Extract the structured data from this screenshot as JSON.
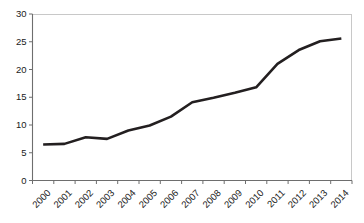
{
  "chart_data": {
    "type": "line",
    "title": "",
    "subtitle": "",
    "xlabel": "",
    "ylabel": "",
    "categories": [
      "2000",
      "2001",
      "2002",
      "2003",
      "2004",
      "2005",
      "2006",
      "2007",
      "2008",
      "2009",
      "2010",
      "2011",
      "2012",
      "2013",
      "2014"
    ],
    "series": [
      {
        "name": "",
        "values": [
          6.5,
          6.6,
          7.8,
          7.5,
          9.0,
          9.9,
          11.5,
          14.1,
          14.9,
          15.8,
          16.8,
          21.0,
          23.5,
          25.1,
          25.6
        ]
      }
    ],
    "ylim": [
      0,
      30
    ],
    "yticks": [
      0,
      5,
      10,
      15,
      20,
      25,
      30
    ],
    "ytick_labels": [
      "0",
      "5",
      "10",
      "15",
      "20",
      "25",
      "30"
    ],
    "grid": false,
    "legend": false,
    "legend_position": "none",
    "line_color": "#231f20",
    "axis_color": "#6e6e6e",
    "background_color": "#ffffff",
    "plot_border_color": "#c8c8c8",
    "xtick_rotation_degrees": -45
  }
}
